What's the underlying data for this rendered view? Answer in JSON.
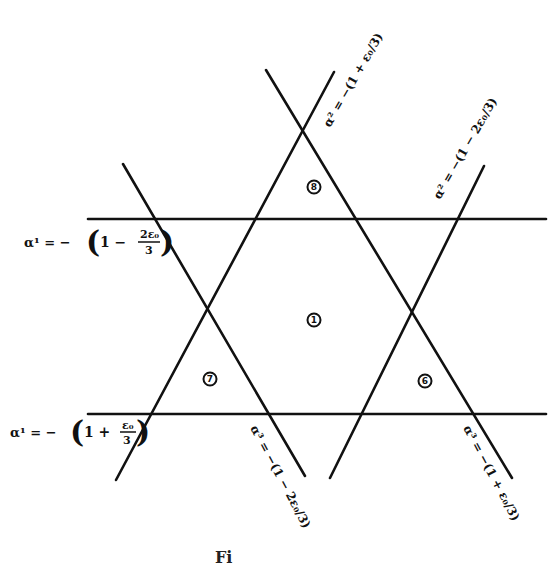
{
  "figure": {
    "caption": "Fi",
    "region_labels": [
      {
        "id": "region-1",
        "text": "1",
        "x": 314,
        "y": 320
      },
      {
        "id": "region-8",
        "text": "8",
        "x": 314,
        "y": 187
      },
      {
        "id": "region-7",
        "text": "7",
        "x": 210,
        "y": 379
      },
      {
        "id": "region-6",
        "text": "6",
        "x": 425,
        "y": 381
      }
    ],
    "line_labels": {
      "top_horizontal": {
        "lhs": "α¹ = −",
        "paren_open": "(",
        "one": "1 −",
        "num": "2ε₀",
        "den": "3",
        "paren_close": ")"
      },
      "bottom_horizontal": {
        "lhs": "α¹ = −",
        "paren_open": "(",
        "one": "1 +",
        "num": "ε₀",
        "den": "3",
        "paren_close": ")"
      },
      "upper_diag_center": {
        "text": "α² = −(1 + ε₀/3)"
      },
      "upper_diag_right": {
        "text": "α² = −(1 − 2ε₀/3)"
      },
      "lower_diag_center": {
        "text": "α³ = −(1 − 2ε₀/3)"
      },
      "lower_diag_right": {
        "text": "α³ = −(1 + ε₀/3)"
      }
    }
  }
}
